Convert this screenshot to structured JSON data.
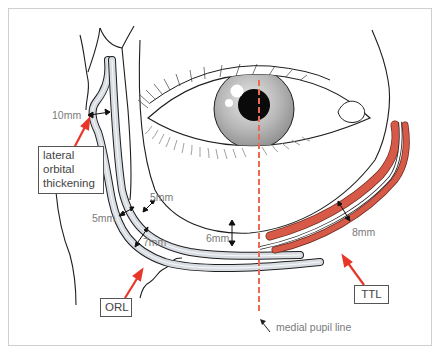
{
  "diagram": {
    "colors": {
      "line": "#1e1e1e",
      "ligament_fill": "#d8dde3",
      "ttl_red": "#d65a47",
      "arrow_red": "#e8372a",
      "dashed_line": "#e8372a",
      "label_text": "#7a7a7a",
      "frame": "#cfcfcf"
    },
    "callouts": {
      "lateral_orbital_thickening": [
        "lateral",
        "orbital",
        "thickening"
      ],
      "orl": "ORL",
      "ttl": "TTL"
    },
    "measurements": {
      "lateral": "10mm",
      "inner_5": "5mm",
      "outer_5": "5mm",
      "seven": "7mm",
      "six": "6mm",
      "eight": "8mm"
    },
    "annotations": {
      "medial_pupil_line": "medial pupil line"
    }
  }
}
